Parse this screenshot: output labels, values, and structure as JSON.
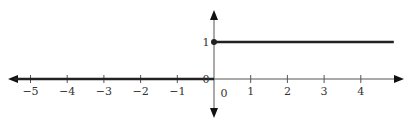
{
  "chart_data": {
    "type": "line",
    "title": "",
    "xlabel": "",
    "ylabel": "",
    "xlim": [
      -5.5,
      5.1
    ],
    "ylim": [
      -0.9,
      1.8
    ],
    "grid": false,
    "legend": null,
    "x_ticks": [
      -5,
      -4,
      -3,
      -2,
      -1,
      0,
      1,
      2,
      3,
      4
    ],
    "x_tick_labels": [
      "−5",
      "−4",
      "−3",
      "−2",
      "−1",
      "0",
      "1",
      "2",
      "3",
      "4"
    ],
    "y_ticks": [
      0,
      1
    ],
    "y_tick_labels": [
      "0",
      "1"
    ],
    "series": [
      {
        "name": "step-left",
        "description": "y = 0 for x < 0",
        "x": [
          -5.6,
          0
        ],
        "y": [
          0,
          0
        ]
      },
      {
        "name": "step-right",
        "description": "y = 1 for x >= 0",
        "x": [
          0,
          4.9
        ],
        "y": [
          1,
          1
        ]
      }
    ],
    "points": [
      {
        "x": 0,
        "y": 1,
        "style": "filled"
      },
      {
        "x": 0,
        "y": 0,
        "style": "open"
      }
    ],
    "annotations": [
      "Unit step (Heaviside) function: H(x) = 0 for x < 0, 1 for x ≥ 0"
    ]
  },
  "colors": {
    "axis": "#555555",
    "line": "#222222",
    "text": "#333333"
  }
}
